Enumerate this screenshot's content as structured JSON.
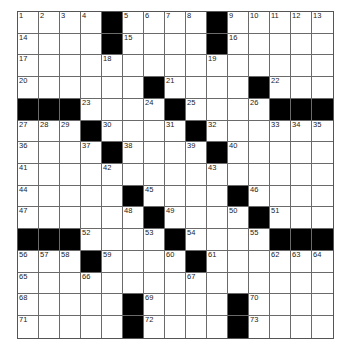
{
  "puzzle": {
    "rows": 15,
    "cols": 15,
    "colors": {
      "block": "#000000",
      "cell": "#ffffff",
      "line": "#6a6a6a"
    },
    "grid": [
      [
        "1",
        "2",
        "3",
        "4",
        "#",
        "5",
        "6",
        "7",
        "8",
        "#",
        "9",
        "10",
        "11",
        "12",
        "13"
      ],
      [
        "14",
        "",
        "",
        "",
        "#",
        "15",
        "",
        "",
        "",
        "#",
        "16",
        "",
        "",
        "",
        ""
      ],
      [
        "17",
        "",
        "",
        "",
        "18",
        "",
        "",
        "",
        "",
        "19",
        "",
        "",
        "",
        "",
        ""
      ],
      [
        "20",
        "",
        "",
        "",
        "",
        "",
        "#",
        "21",
        "",
        "",
        "",
        "#",
        "22",
        "",
        ""
      ],
      [
        "#",
        "#",
        "#",
        "23",
        "",
        "",
        "24",
        "#",
        "25",
        "",
        "",
        "26",
        "#",
        "#",
        "#"
      ],
      [
        "27",
        "28",
        "29",
        "#",
        "30",
        "",
        "",
        "31",
        "#",
        "32",
        "",
        "",
        "33",
        "34",
        "35"
      ],
      [
        "36",
        "",
        "",
        "37",
        "#",
        "38",
        "",
        "",
        "39",
        "#",
        "40",
        "",
        "",
        "",
        ""
      ],
      [
        "41",
        "",
        "",
        "",
        "42",
        "",
        "",
        "",
        "",
        "43",
        "",
        "",
        "",
        "",
        ""
      ],
      [
        "44",
        "",
        "",
        "",
        "",
        "#",
        "45",
        "",
        "",
        "",
        "#",
        "46",
        "",
        "",
        ""
      ],
      [
        "47",
        "",
        "",
        "",
        "",
        "48",
        "#",
        "49",
        "",
        "",
        "50",
        "#",
        "51",
        "",
        ""
      ],
      [
        "#",
        "#",
        "#",
        "52",
        "",
        "",
        "53",
        "#",
        "54",
        "",
        "",
        "55",
        "#",
        "#",
        "#"
      ],
      [
        "56",
        "57",
        "58",
        "#",
        "59",
        "",
        "",
        "60",
        "#",
        "61",
        "",
        "",
        "62",
        "63",
        "64"
      ],
      [
        "65",
        "",
        "",
        "66",
        "",
        "",
        "",
        "",
        "67",
        "",
        "",
        "",
        "",
        "",
        ""
      ],
      [
        "68",
        "",
        "",
        "",
        "",
        "#",
        "69",
        "",
        "",
        "",
        "#",
        "70",
        "",
        "",
        ""
      ],
      [
        "71",
        "",
        "",
        "",
        "",
        "#",
        "72",
        "",
        "",
        "",
        "#",
        "73",
        "",
        "",
        ""
      ]
    ]
  }
}
